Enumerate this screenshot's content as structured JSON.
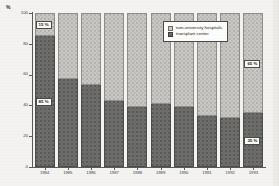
{
  "axis": {
    "unit_label": "%",
    "y_ticks": [
      "0",
      "20",
      "40",
      "60",
      "80",
      "100"
    ]
  },
  "legend": {
    "items": [
      {
        "label": "non-university hospitals",
        "swatch": "light-hatched-swatch",
        "color": "#c9c8c4"
      },
      {
        "label": "transplant center",
        "swatch": "dark-hatched-swatch",
        "color": "#6e6e6c"
      }
    ]
  },
  "callouts": [
    {
      "id": "callout-top-left",
      "text": "15 %"
    },
    {
      "id": "callout-bottom-left",
      "text": "85 %"
    },
    {
      "id": "callout-top-right",
      "text": "65 %"
    },
    {
      "id": "callout-bottom-right",
      "text": "35 %"
    }
  ],
  "chart_data": {
    "type": "bar",
    "stacked": true,
    "title": "",
    "xlabel": "",
    "ylabel": "%",
    "ylim": [
      0,
      100
    ],
    "grid": false,
    "legend_position": "inside-top-right",
    "categories": [
      "1984",
      "1985",
      "1986",
      "1987",
      "1988",
      "1989",
      "1990",
      "1991",
      "1992",
      "1993"
    ],
    "series": [
      {
        "name": "transplant center",
        "color": "#6e6e6c",
        "values": [
          85,
          57,
          53,
          43,
          39,
          41,
          39,
          33,
          32,
          35
        ]
      },
      {
        "name": "non-university hospitals",
        "color": "#c9c8c4",
        "values": [
          15,
          43,
          47,
          57,
          61,
          59,
          61,
          67,
          68,
          65
        ]
      }
    ]
  }
}
